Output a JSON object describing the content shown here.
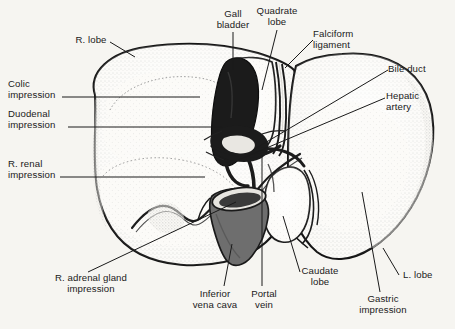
{
  "figure": {
    "background_color": "#f6f5f1",
    "ink_color": "#1a1a1a",
    "gallbladder_color": "#1b1b1b",
    "vena_cava_color": "#6e6e6e",
    "parenchyma_color": "#fbfaf7",
    "stipple_color": "#9a9a9a"
  },
  "labels": {
    "r_lobe": "R. lobe",
    "gall_bladder": "Gall\nbladder",
    "quadrate_lobe": "Quadrate\nlobe",
    "falciform_ligament": "Falciform\nligament",
    "bile_duct": "Bile duct",
    "hepatic_artery": "Hepatic\nartery",
    "colic_impression": "Colic\nimpression",
    "duodenal_impression": "Duodenal\nimpression",
    "r_renal_impression": "R. renal\nimpression",
    "r_adrenal_gland_impression": "R. adrenal gland\nimpression",
    "inferior_vena_cava": "Inferior\nvena cava",
    "portal_vein": "Portal\nvein",
    "caudate_lobe": "Caudate\nlobe",
    "l_lobe": "L. lobe",
    "gastric_impression": "Gastric\nimpression"
  }
}
